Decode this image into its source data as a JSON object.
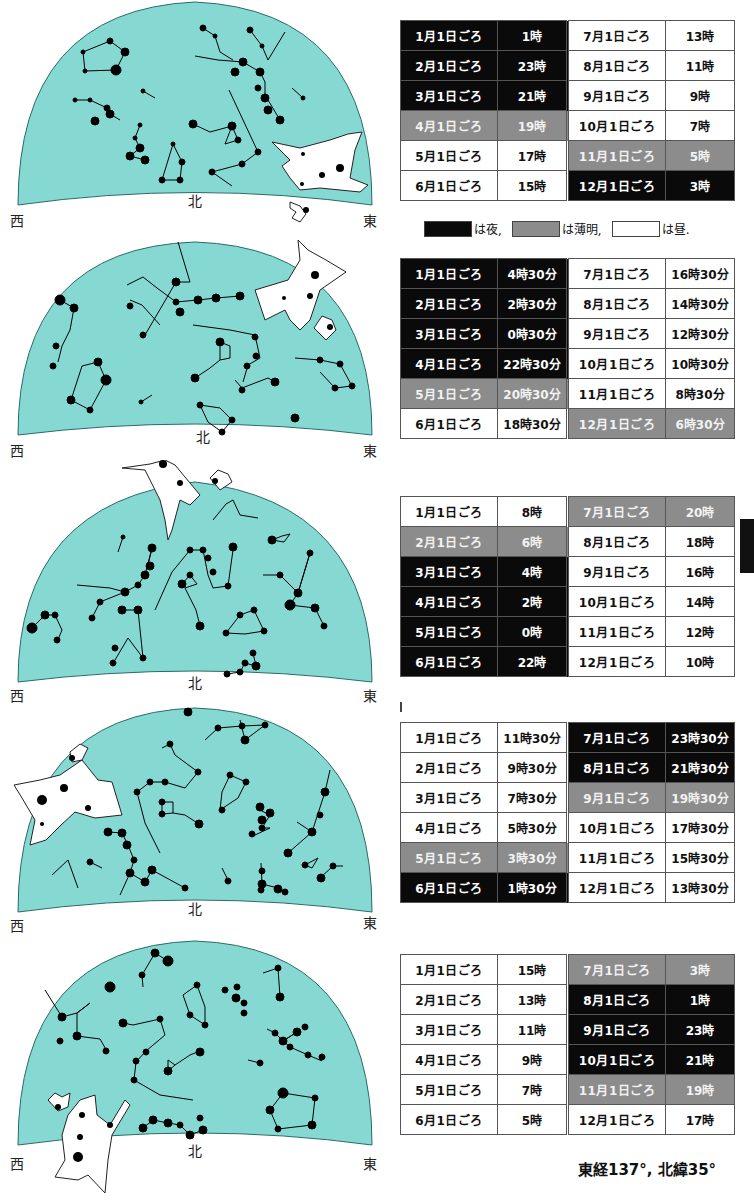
{
  "colors": {
    "sky": "#86d9d2",
    "sky_stroke": "#2a6b66",
    "night": "#0a0a0a",
    "twilight": "#8c8c8c",
    "day": "#ffffff"
  },
  "directions": {
    "west": "西",
    "north": "北",
    "east": "東"
  },
  "legend": {
    "night_label": "は夜,",
    "twilight_label": "は薄明,",
    "day_label": "は昼."
  },
  "coordinates": "東経137°, 北緯35°",
  "charts": [
    {
      "id": 1,
      "table": [
        [
          {
            "date": "1月1日ごろ",
            "time": "1時",
            "s": "n"
          },
          {
            "date": "7月1日ごろ",
            "time": "13時",
            "s": "d"
          }
        ],
        [
          {
            "date": "2月1日ごろ",
            "time": "23時",
            "s": "n"
          },
          {
            "date": "8月1日ごろ",
            "time": "11時",
            "s": "d"
          }
        ],
        [
          {
            "date": "3月1日ごろ",
            "time": "21時",
            "s": "n"
          },
          {
            "date": "9月1日ごろ",
            "time": "9時",
            "s": "d"
          }
        ],
        [
          {
            "date": "4月1日ごろ",
            "time": "19時",
            "s": "t"
          },
          {
            "date": "10月1日ごろ",
            "time": "7時",
            "s": "d"
          }
        ],
        [
          {
            "date": "5月1日ごろ",
            "time": "17時",
            "s": "d"
          },
          {
            "date": "11月1日ごろ",
            "time": "5時",
            "s": "t"
          }
        ],
        [
          {
            "date": "6月1日ごろ",
            "time": "15時",
            "s": "d"
          },
          {
            "date": "12月1日ごろ",
            "time": "3時",
            "s": "n"
          }
        ]
      ]
    },
    {
      "id": 2,
      "table": [
        [
          {
            "date": "1月1日ごろ",
            "time": "4時30分",
            "s": "n"
          },
          {
            "date": "7月1日ごろ",
            "time": "16時30分",
            "s": "d"
          }
        ],
        [
          {
            "date": "2月1日ごろ",
            "time": "2時30分",
            "s": "n"
          },
          {
            "date": "8月1日ごろ",
            "time": "14時30分",
            "s": "d"
          }
        ],
        [
          {
            "date": "3月1日ごろ",
            "time": "0時30分",
            "s": "n"
          },
          {
            "date": "9月1日ごろ",
            "time": "12時30分",
            "s": "d"
          }
        ],
        [
          {
            "date": "4月1日ごろ",
            "time": "22時30分",
            "s": "n"
          },
          {
            "date": "10月1日ごろ",
            "time": "10時30分",
            "s": "d"
          }
        ],
        [
          {
            "date": "5月1日ごろ",
            "time": "20時30分",
            "s": "t"
          },
          {
            "date": "11月1日ごろ",
            "time": "8時30分",
            "s": "d"
          }
        ],
        [
          {
            "date": "6月1日ごろ",
            "time": "18時30分",
            "s": "d"
          },
          {
            "date": "12月1日ごろ",
            "time": "6時30分",
            "s": "t"
          }
        ]
      ]
    },
    {
      "id": 3,
      "table": [
        [
          {
            "date": "1月1日ごろ",
            "time": "8時",
            "s": "d"
          },
          {
            "date": "7月1日ごろ",
            "time": "20時",
            "s": "t"
          }
        ],
        [
          {
            "date": "2月1日ごろ",
            "time": "6時",
            "s": "t"
          },
          {
            "date": "8月1日ごろ",
            "time": "18時",
            "s": "d"
          }
        ],
        [
          {
            "date": "3月1日ごろ",
            "time": "4時",
            "s": "n"
          },
          {
            "date": "9月1日ごろ",
            "time": "16時",
            "s": "d"
          }
        ],
        [
          {
            "date": "4月1日ごろ",
            "time": "2時",
            "s": "n"
          },
          {
            "date": "10月1日ごろ",
            "time": "14時",
            "s": "d"
          }
        ],
        [
          {
            "date": "5月1日ごろ",
            "time": "0時",
            "s": "n"
          },
          {
            "date": "11月1日ごろ",
            "time": "12時",
            "s": "d"
          }
        ],
        [
          {
            "date": "6月1日ごろ",
            "time": "22時",
            "s": "n"
          },
          {
            "date": "12月1日ごろ",
            "time": "10時",
            "s": "d"
          }
        ]
      ]
    },
    {
      "id": 4,
      "table": [
        [
          {
            "date": "1月1日ごろ",
            "time": "11時30分",
            "s": "d"
          },
          {
            "date": "7月1日ごろ",
            "time": "23時30分",
            "s": "n"
          }
        ],
        [
          {
            "date": "2月1日ごろ",
            "time": "9時30分",
            "s": "d"
          },
          {
            "date": "8月1日ごろ",
            "time": "21時30分",
            "s": "n"
          }
        ],
        [
          {
            "date": "3月1日ごろ",
            "time": "7時30分",
            "s": "d"
          },
          {
            "date": "9月1日ごろ",
            "time": "19時30分",
            "s": "t"
          }
        ],
        [
          {
            "date": "4月1日ごろ",
            "time": "5時30分",
            "s": "d"
          },
          {
            "date": "10月1日ごろ",
            "time": "17時30分",
            "s": "d"
          }
        ],
        [
          {
            "date": "5月1日ごろ",
            "time": "3時30分",
            "s": "t"
          },
          {
            "date": "11月1日ごろ",
            "time": "15時30分",
            "s": "d"
          }
        ],
        [
          {
            "date": "6月1日ごろ",
            "time": "1時30分",
            "s": "n"
          },
          {
            "date": "12月1日ごろ",
            "time": "13時30分",
            "s": "d"
          }
        ]
      ]
    },
    {
      "id": 5,
      "table": [
        [
          {
            "date": "1月1日ごろ",
            "time": "15時",
            "s": "d"
          },
          {
            "date": "7月1日ごろ",
            "time": "3時",
            "s": "t"
          }
        ],
        [
          {
            "date": "2月1日ごろ",
            "time": "13時",
            "s": "d"
          },
          {
            "date": "8月1日ごろ",
            "time": "1時",
            "s": "n"
          }
        ],
        [
          {
            "date": "3月1日ごろ",
            "time": "11時",
            "s": "d"
          },
          {
            "date": "9月1日ごろ",
            "time": "23時",
            "s": "n"
          }
        ],
        [
          {
            "date": "4月1日ごろ",
            "time": "9時",
            "s": "d"
          },
          {
            "date": "10月1日ごろ",
            "time": "21時",
            "s": "n"
          }
        ],
        [
          {
            "date": "5月1日ごろ",
            "time": "7時",
            "s": "d"
          },
          {
            "date": "11月1日ごろ",
            "time": "19時",
            "s": "t"
          }
        ],
        [
          {
            "date": "6月1日ごろ",
            "time": "5時",
            "s": "d"
          },
          {
            "date": "12月1日ごろ",
            "time": "17時",
            "s": "d"
          }
        ]
      ]
    }
  ]
}
